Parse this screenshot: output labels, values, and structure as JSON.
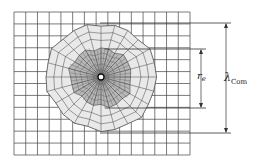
{
  "figure": {
    "type": "mesh-diagram",
    "grid": {
      "cols": 15,
      "rows": 12,
      "x0": 14,
      "y0": 12,
      "x1": 190,
      "y1": 155
    },
    "radial_mesh": {
      "cx": 101,
      "cy": 77,
      "outer_radius": 54,
      "inner_radius": 30,
      "center_radius": 3
    },
    "dimensions": [
      {
        "id": "r_e",
        "symbol": "r",
        "subscript": "e",
        "top_y": 49,
        "bottom_y": 108,
        "arrow_x": 201
      },
      {
        "id": "lambda_com",
        "symbol": "λ",
        "subscript": "Com",
        "top_y": 23,
        "bottom_y": 133,
        "arrow_x": 226
      }
    ]
  },
  "labels": {
    "re_symbol": "r",
    "re_sub": "e",
    "lambda_symbol": "λ",
    "lambda_sub": "Com"
  },
  "colors": {
    "grid_line": "#444444",
    "outer_ring_fill": "#e9e9e9",
    "inner_ring_fill": "#b8b8b8",
    "dimension_line": "#333333"
  }
}
